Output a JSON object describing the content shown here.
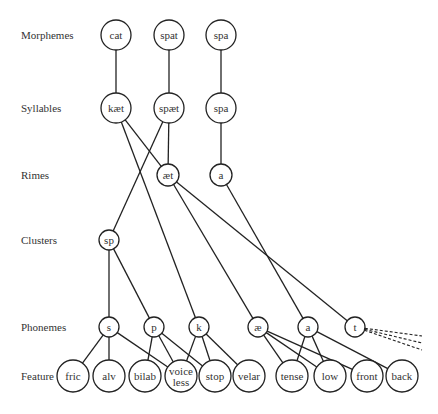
{
  "levels": [
    {
      "id": "morphemes",
      "label": "Morphemes"
    },
    {
      "id": "syllables",
      "label": "Syllables"
    },
    {
      "id": "rimes",
      "label": "Rimes"
    },
    {
      "id": "clusters",
      "label": "Clusters"
    },
    {
      "id": "phonemes",
      "label": "Phonemes"
    },
    {
      "id": "feature",
      "label": "Feature"
    }
  ],
  "nodes": [
    {
      "id": "m-cat",
      "level": "morphemes",
      "label": "cat"
    },
    {
      "id": "m-spat",
      "level": "morphemes",
      "label": "spat"
    },
    {
      "id": "m-spa",
      "level": "morphemes",
      "label": "spa"
    },
    {
      "id": "s-kaet",
      "level": "syllables",
      "label": "kæt"
    },
    {
      "id": "s-spaet",
      "level": "syllables",
      "label": "spæt"
    },
    {
      "id": "s-spa",
      "level": "syllables",
      "label": "spa"
    },
    {
      "id": "r-aet",
      "level": "rimes",
      "label": "æt"
    },
    {
      "id": "r-a",
      "level": "rimes",
      "label": "a"
    },
    {
      "id": "c-sp",
      "level": "clusters",
      "label": "sp"
    },
    {
      "id": "p-s",
      "level": "phonemes",
      "label": "s"
    },
    {
      "id": "p-p",
      "level": "phonemes",
      "label": "p"
    },
    {
      "id": "p-k",
      "level": "phonemes",
      "label": "k"
    },
    {
      "id": "p-ae",
      "level": "phonemes",
      "label": "æ"
    },
    {
      "id": "p-a",
      "level": "phonemes",
      "label": "a"
    },
    {
      "id": "p-t",
      "level": "phonemes",
      "label": "t"
    },
    {
      "id": "f-fric",
      "level": "feature",
      "label": "fric"
    },
    {
      "id": "f-alv",
      "level": "feature",
      "label": "alv"
    },
    {
      "id": "f-bilab",
      "level": "feature",
      "label": "bilab"
    },
    {
      "id": "f-voiceless",
      "level": "feature",
      "label": "voice\nless"
    },
    {
      "id": "f-stop",
      "level": "feature",
      "label": "stop"
    },
    {
      "id": "f-velar",
      "level": "feature",
      "label": "velar"
    },
    {
      "id": "f-tense",
      "level": "feature",
      "label": "tense"
    },
    {
      "id": "f-low",
      "level": "feature",
      "label": "low"
    },
    {
      "id": "f-front",
      "level": "feature",
      "label": "front"
    },
    {
      "id": "f-back",
      "level": "feature",
      "label": "back"
    }
  ],
  "edges": [
    {
      "from": "m-cat",
      "to": "s-kaet"
    },
    {
      "from": "m-spat",
      "to": "s-spaet"
    },
    {
      "from": "m-spa",
      "to": "s-spa"
    },
    {
      "from": "s-kaet",
      "to": "r-aet"
    },
    {
      "from": "s-kaet",
      "to": "p-k"
    },
    {
      "from": "s-spaet",
      "to": "r-aet"
    },
    {
      "from": "s-spaet",
      "to": "c-sp"
    },
    {
      "from": "s-spa",
      "to": "r-a"
    },
    {
      "from": "r-aet",
      "to": "p-ae"
    },
    {
      "from": "r-aet",
      "to": "p-t"
    },
    {
      "from": "r-a",
      "to": "p-a"
    },
    {
      "from": "c-sp",
      "to": "p-s"
    },
    {
      "from": "c-sp",
      "to": "p-p"
    },
    {
      "from": "p-s",
      "to": "f-fric"
    },
    {
      "from": "p-s",
      "to": "f-alv"
    },
    {
      "from": "p-s",
      "to": "f-voiceless"
    },
    {
      "from": "p-p",
      "to": "f-bilab"
    },
    {
      "from": "p-p",
      "to": "f-voiceless"
    },
    {
      "from": "p-p",
      "to": "f-stop"
    },
    {
      "from": "p-k",
      "to": "f-voiceless"
    },
    {
      "from": "p-k",
      "to": "f-stop"
    },
    {
      "from": "p-k",
      "to": "f-velar"
    },
    {
      "from": "p-ae",
      "to": "f-tense"
    },
    {
      "from": "p-ae",
      "to": "f-low"
    },
    {
      "from": "p-ae",
      "to": "f-front"
    },
    {
      "from": "p-a",
      "to": "f-tense"
    },
    {
      "from": "p-a",
      "to": "f-low"
    },
    {
      "from": "p-a",
      "to": "f-back"
    }
  ],
  "dashed_edges": [
    {
      "from": "p-t",
      "count": 3,
      "note": "continues off-figure"
    }
  ]
}
